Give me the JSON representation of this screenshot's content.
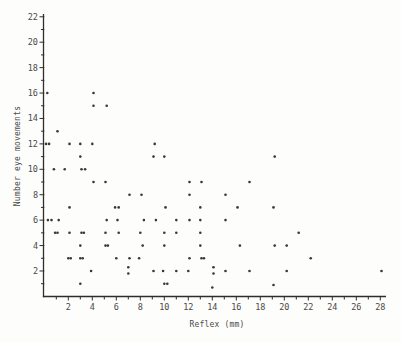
{
  "figure": {
    "paper_color": "#fdfdfc",
    "ink_color": "#383838",
    "label_color": "#4a4a4a",
    "axis_color": "#2e2e2e"
  },
  "chart_data": {
    "type": "scatter",
    "title": "",
    "xlabel": "Reflex (mm)",
    "ylabel": "Number eye movements",
    "xlim": [
      0,
      29
    ],
    "ylim": [
      0,
      22.5
    ],
    "x_tick_labels": [
      2,
      4,
      6,
      8,
      10,
      12,
      14,
      16,
      18,
      20,
      22,
      24,
      26,
      28
    ],
    "y_tick_labels": [
      2,
      4,
      6,
      8,
      10,
      12,
      14,
      16,
      18,
      20,
      22
    ],
    "minor_tick_interval": 1,
    "grid": false,
    "legend": null,
    "marker": "dot",
    "points": [
      [
        0.25,
        16
      ],
      [
        4.1,
        16
      ],
      [
        4.1,
        15
      ],
      [
        5.2,
        15
      ],
      [
        1.1,
        13
      ],
      [
        0.15,
        12
      ],
      [
        0.4,
        12
      ],
      [
        2.1,
        12
      ],
      [
        3.0,
        12
      ],
      [
        4.0,
        12
      ],
      [
        9.2,
        12
      ],
      [
        3.0,
        11
      ],
      [
        9.1,
        11
      ],
      [
        10.0,
        11
      ],
      [
        19.2,
        11
      ],
      [
        0.8,
        10
      ],
      [
        1.7,
        10
      ],
      [
        3.1,
        10
      ],
      [
        3.4,
        10
      ],
      [
        4.1,
        9
      ],
      [
        5.1,
        9
      ],
      [
        12.1,
        9
      ],
      [
        13.1,
        9
      ],
      [
        17.1,
        9
      ],
      [
        7.1,
        8
      ],
      [
        8.1,
        8
      ],
      [
        12.1,
        8
      ],
      [
        15.1,
        8
      ],
      [
        2.1,
        7
      ],
      [
        5.9,
        7
      ],
      [
        6.2,
        7
      ],
      [
        10.1,
        7
      ],
      [
        13.0,
        7
      ],
      [
        16.1,
        7
      ],
      [
        19.1,
        7
      ],
      [
        0.3,
        6
      ],
      [
        0.6,
        6
      ],
      [
        1.2,
        6
      ],
      [
        5.2,
        6
      ],
      [
        6.1,
        6
      ],
      [
        8.3,
        6
      ],
      [
        9.3,
        6
      ],
      [
        11.0,
        6
      ],
      [
        12.1,
        6
      ],
      [
        13.0,
        6
      ],
      [
        15.1,
        6
      ],
      [
        0.9,
        5
      ],
      [
        1.1,
        5
      ],
      [
        2.1,
        5
      ],
      [
        3.1,
        5
      ],
      [
        3.3,
        5
      ],
      [
        5.1,
        5
      ],
      [
        6.2,
        5
      ],
      [
        8.0,
        5
      ],
      [
        10.0,
        5
      ],
      [
        11.0,
        5
      ],
      [
        13.0,
        5
      ],
      [
        21.2,
        5
      ],
      [
        3.0,
        4
      ],
      [
        5.1,
        4
      ],
      [
        5.3,
        4
      ],
      [
        8.2,
        4
      ],
      [
        10.0,
        4
      ],
      [
        13.0,
        4
      ],
      [
        16.3,
        4
      ],
      [
        19.2,
        4
      ],
      [
        20.2,
        4
      ],
      [
        2.0,
        3
      ],
      [
        2.2,
        3
      ],
      [
        3.0,
        3
      ],
      [
        3.2,
        3
      ],
      [
        6.0,
        3
      ],
      [
        7.1,
        3
      ],
      [
        7.9,
        3
      ],
      [
        12.1,
        3
      ],
      [
        13.1,
        3
      ],
      [
        13.3,
        3
      ],
      [
        22.2,
        3
      ],
      [
        3.9,
        2
      ],
      [
        7.0,
        1.8
      ],
      [
        7.0,
        2.3
      ],
      [
        9.1,
        2
      ],
      [
        9.9,
        2
      ],
      [
        11.0,
        2
      ],
      [
        12.0,
        2
      ],
      [
        14.1,
        1.8
      ],
      [
        14.1,
        2.3
      ],
      [
        15.1,
        2
      ],
      [
        17.1,
        2
      ],
      [
        20.2,
        2
      ],
      [
        28.1,
        2
      ],
      [
        3.0,
        1
      ],
      [
        10.0,
        1
      ],
      [
        10.25,
        1
      ],
      [
        14.0,
        0.7
      ],
      [
        19.1,
        0.9
      ]
    ]
  }
}
